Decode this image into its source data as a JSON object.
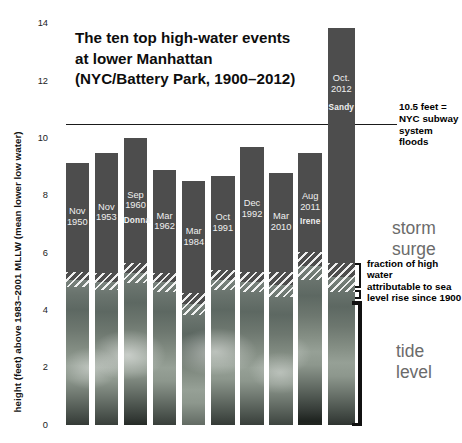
{
  "title": {
    "lines": [
      "The ten top high-water events",
      "at lower Manhattan",
      "(NYC/Battery Park, 1900–2012)"
    ]
  },
  "y_axis": {
    "label": "height (feet) above 1983–2001 MLLW (mean lower low water)",
    "ticks": [
      14,
      12,
      10,
      8,
      6,
      4,
      2,
      0
    ]
  },
  "chart_data": {
    "type": "bar",
    "title": "The ten top high-water events at lower Manhattan (NYC/Battery Park, 1900–2012)",
    "ylabel": "height (feet) above 1983–2001 MLLW (mean lower low water)",
    "ylim": [
      0,
      14
    ],
    "grid": false,
    "stack_components": [
      "tide level",
      "fraction of high water attributable to sea level rise since 1900",
      "storm surge"
    ],
    "events": [
      {
        "month": "Nov",
        "year": "1950",
        "storm": "",
        "total_ft": 9.15,
        "slr_band_top_ft": 5.35,
        "tide_ft": 4.8
      },
      {
        "month": "Nov",
        "year": "1953",
        "storm": "",
        "total_ft": 9.5,
        "slr_band_top_ft": 5.3,
        "tide_ft": 4.7
      },
      {
        "month": "Sep",
        "year": "1960",
        "storm": "Donna",
        "total_ft": 10.0,
        "slr_band_top_ft": 5.65,
        "tide_ft": 4.95
      },
      {
        "month": "Mar",
        "year": "1962",
        "storm": "",
        "total_ft": 8.9,
        "slr_band_top_ft": 5.3,
        "tide_ft": 4.65
      },
      {
        "month": "Mar",
        "year": "1984",
        "storm": "",
        "total_ft": 8.5,
        "slr_band_top_ft": 4.6,
        "tide_ft": 3.85
      },
      {
        "month": "Oct",
        "year": "1991",
        "storm": "",
        "total_ft": 8.7,
        "slr_band_top_ft": 5.4,
        "tide_ft": 4.7
      },
      {
        "month": "Dec",
        "year": "1992",
        "storm": "",
        "total_ft": 9.7,
        "slr_band_top_ft": 5.35,
        "tide_ft": 4.65
      },
      {
        "month": "Mar",
        "year": "2010",
        "storm": "",
        "total_ft": 8.8,
        "slr_band_top_ft": 5.35,
        "tide_ft": 4.45
      },
      {
        "month": "Aug",
        "year": "2011",
        "storm": "Irene",
        "total_ft": 9.5,
        "slr_band_top_ft": 6.05,
        "tide_ft": 5.05
      },
      {
        "month": "Oct.",
        "year": "2012",
        "storm": "Sandy",
        "total_ft": 13.85,
        "slr_band_top_ft": 5.65,
        "tide_ft": 4.65
      }
    ],
    "reference_line": {
      "value_ft": 10.5,
      "label": "10.5 feet = NYC subway system floods"
    }
  },
  "annotations": {
    "ref_label_lines": [
      "10.5 feet =",
      "NYC subway",
      "system floods"
    ],
    "storm_surge": "storm surge",
    "slr_fraction_lines": [
      "fraction of high water",
      "attributable to sea",
      "level rise since 1900"
    ],
    "tide_level": "tide level"
  },
  "colors": {
    "bar_surge": "#4d4d4d",
    "annotation_gray": "#6b6b6b",
    "text": "#0d0d0d",
    "reference_line": "#1a1a1a"
  }
}
